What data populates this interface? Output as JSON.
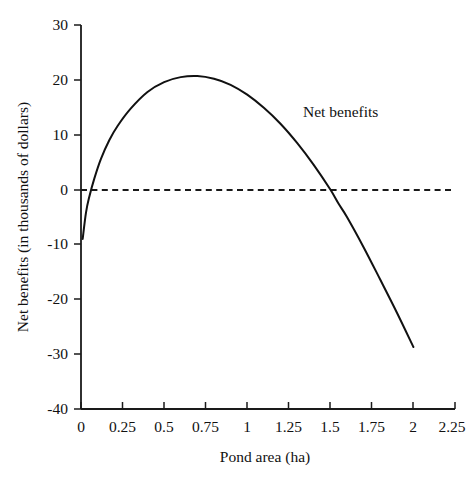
{
  "chart_data": {
    "type": "line",
    "title": "",
    "subtitle": "",
    "xlabel": "Pond area (ha)",
    "ylabel": "Net benefits (in thousands of dollars)",
    "xlim": [
      0,
      2.25
    ],
    "ylim": [
      -40,
      30
    ],
    "xticks": [
      0,
      0.25,
      0.5,
      0.75,
      1,
      1.25,
      1.5,
      1.75,
      2,
      2.25
    ],
    "xtick_labels": [
      "0",
      "0.25",
      "0.5",
      "0.75",
      "1",
      "1.25",
      "1.5",
      "1.75",
      "2",
      "2.25"
    ],
    "yticks": [
      30,
      20,
      10,
      0,
      -10,
      -20,
      -30,
      -40
    ],
    "ytick_labels": [
      "30",
      "20",
      "10",
      "0",
      "-10",
      "-20",
      "-30",
      "-40"
    ],
    "grid": false,
    "legend_position": "inline-annotation",
    "annotations": [
      {
        "text": "Net benefits",
        "x": 1.25,
        "y": 14.5
      }
    ],
    "reference_lines": [
      {
        "label": "zero",
        "orientation": "horizontal",
        "y": 0,
        "style": "dashed"
      }
    ],
    "series": [
      {
        "name": "Net benefits",
        "style": "solid",
        "color": "#111111",
        "x": [
          0.01,
          0.03,
          0.05,
          0.08,
          0.12,
          0.17,
          0.22,
          0.3,
          0.4,
          0.5,
          0.6,
          0.7,
          0.8,
          0.9,
          1.0,
          1.1,
          1.2,
          1.3,
          1.4,
          1.5,
          1.55,
          1.6,
          1.7,
          1.8,
          1.9,
          2.0
        ],
        "y": [
          -9.0,
          -4.2,
          -1.3,
          2.0,
          5.6,
          9.0,
          11.6,
          14.8,
          17.8,
          19.6,
          20.5,
          20.7,
          20.2,
          19.1,
          17.3,
          14.9,
          12.0,
          8.5,
          4.5,
          0.0,
          -2.6,
          -5.0,
          -10.5,
          -16.4,
          -22.4,
          -28.7
        ]
      }
    ]
  },
  "axis": {
    "x_title": "Pond area (ha)",
    "y_title": "Net benefits (in thousands of dollars)"
  },
  "annotation": {
    "net_benefits_label": "Net benefits"
  },
  "colors": {
    "curve": "#111111",
    "axis": "#1a1a1a",
    "background": "#ffffff"
  }
}
